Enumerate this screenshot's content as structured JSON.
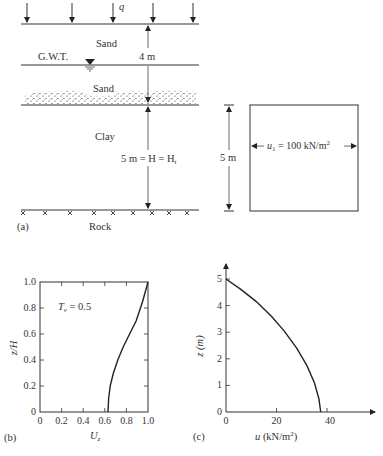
{
  "panel_a": {
    "caption": "(a)",
    "load_label": "q",
    "layers": [
      {
        "name": "Sand",
        "position": "top"
      },
      {
        "name": "Sand",
        "position": "middle"
      },
      {
        "name": "Clay",
        "position": "lower"
      },
      {
        "name": "Rock",
        "position": "base"
      }
    ],
    "gwt_label": "G.W.T.",
    "dim_4m": "4 m",
    "dim_clay": "5 m = H = H",
    "dim_clay_sub": "t",
    "box": {
      "height_label": "5 m",
      "u_label": "u",
      "u_sub": "1",
      "u_value": " = 100 kN/m",
      "u_sup": "2"
    }
  },
  "chart_data": [
    {
      "panel": "(b)",
      "type": "line",
      "title": "",
      "annotation": "T_v = 0.5",
      "annotation_parts": {
        "T": "T",
        "sub": "v",
        "rest": " = 0.5"
      },
      "xlabel": "U_z",
      "xlabel_parts": {
        "main": "U",
        "sub": "z"
      },
      "ylabel": "z/H",
      "xlim": [
        0,
        1.0
      ],
      "ylim": [
        0,
        1.0
      ],
      "xticks": [
        "0",
        "0.2",
        "0.4",
        "0.6",
        "0.8",
        "1.0"
      ],
      "yticks": [
        "0",
        "0.2",
        "0.4",
        "0.6",
        "0.8",
        "1.0"
      ],
      "grid": false,
      "series": [
        {
          "name": "T_v = 0.5",
          "x": [
            0.63,
            0.635,
            0.65,
            0.68,
            0.72,
            0.77,
            0.83,
            0.89,
            0.95,
            1.0
          ],
          "y": [
            0.0,
            0.1,
            0.2,
            0.3,
            0.4,
            0.5,
            0.6,
            0.7,
            0.85,
            1.0
          ]
        }
      ]
    },
    {
      "panel": "(c)",
      "type": "line",
      "title": "",
      "xlabel": "u (kN/m²)",
      "xlabel_parts": {
        "main": "u",
        "unit": " (kN/m",
        "sup": "2",
        "close": ")"
      },
      "ylabel": "z (m)",
      "xlim": [
        0,
        60
      ],
      "ylim": [
        0,
        5.5
      ],
      "xticks": [
        "0",
        "20",
        "40"
      ],
      "yticks": [
        "0",
        "1",
        "2",
        "3",
        "4",
        "5"
      ],
      "grid": false,
      "series": [
        {
          "name": "excess pore water pressure",
          "x": [
            0,
            6,
            12,
            18,
            23,
            28,
            32,
            35,
            36.8,
            37.5
          ],
          "y": [
            5.0,
            4.6,
            4.15,
            3.6,
            3.05,
            2.4,
            1.75,
            1.1,
            0.5,
            0.0
          ]
        }
      ]
    }
  ],
  "panel_b": {
    "caption": "(b)"
  },
  "panel_c": {
    "caption": "(c)"
  }
}
